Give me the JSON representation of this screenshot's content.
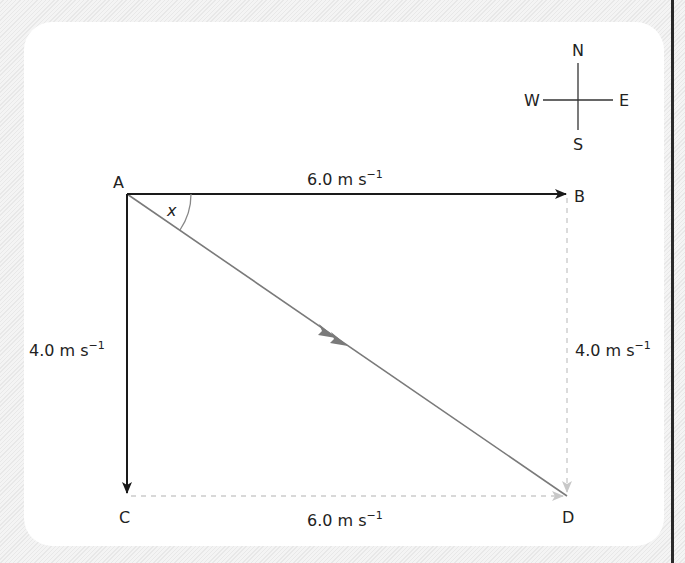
{
  "compass": {
    "north": "N",
    "south": "S",
    "east": "E",
    "west": "W"
  },
  "points": {
    "a": "A",
    "b": "B",
    "c": "C",
    "d": "D"
  },
  "angle_label": "x",
  "vectors": {
    "ab": {
      "value": "6.0 m s",
      "exponent": "−1"
    },
    "ac": {
      "value": "4.0 m s",
      "exponent": "−1"
    },
    "bd": {
      "value": "4.0 m s",
      "exponent": "−1"
    },
    "cd": {
      "value": "6.0 m s",
      "exponent": "−1"
    }
  },
  "colors": {
    "solid": "#1a1a1a",
    "resultant": "#7a7a7a",
    "dashed": "#cccccc"
  }
}
